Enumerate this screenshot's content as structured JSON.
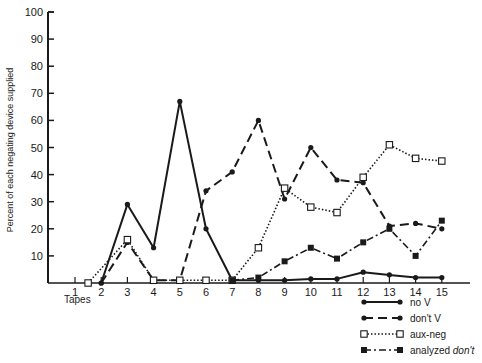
{
  "chart_data": {
    "type": "line",
    "title": "",
    "xlabel": "Tapes",
    "ylabel": "Percent of each negating device supplied",
    "ylim": [
      0,
      100
    ],
    "yticks": [
      10,
      20,
      30,
      40,
      50,
      60,
      70,
      80,
      90,
      100
    ],
    "xticks": [
      1,
      2,
      3,
      4,
      5,
      6,
      7,
      8,
      9,
      10,
      11,
      12,
      13,
      14,
      15
    ],
    "grid": false,
    "legend_position": "bottom-right",
    "series": [
      {
        "name": "no V",
        "style": "solid",
        "marker": "dot",
        "points": [
          [
            2,
            0
          ],
          [
            3,
            29
          ],
          [
            4,
            13
          ],
          [
            5,
            67
          ],
          [
            6,
            20
          ],
          [
            7,
            1
          ],
          [
            8,
            1
          ],
          [
            9,
            1
          ],
          [
            10,
            1.5
          ],
          [
            11,
            1.5
          ],
          [
            12,
            4
          ],
          [
            13,
            3
          ],
          [
            14,
            2
          ],
          [
            15,
            2
          ]
        ]
      },
      {
        "name": "don't V",
        "style": "dashed",
        "marker": "dot",
        "points": [
          [
            2,
            0
          ],
          [
            3,
            15
          ],
          [
            4,
            1
          ],
          [
            5,
            1
          ],
          [
            6,
            34
          ],
          [
            7,
            41
          ],
          [
            8,
            60
          ],
          [
            9,
            31
          ],
          [
            10,
            50
          ],
          [
            11,
            38
          ],
          [
            12,
            37
          ],
          [
            13,
            21
          ],
          [
            14,
            22
          ],
          [
            15,
            20
          ]
        ]
      },
      {
        "name": "aux-neg",
        "style": "dotted",
        "marker": "open-square",
        "points": [
          [
            1.5,
            0
          ],
          [
            3,
            16
          ],
          [
            4,
            1
          ],
          [
            5,
            1
          ],
          [
            6,
            1
          ],
          [
            7,
            1
          ],
          [
            8,
            13
          ],
          [
            9,
            35
          ],
          [
            10,
            28
          ],
          [
            11,
            26
          ],
          [
            12,
            39
          ],
          [
            13,
            51
          ],
          [
            14,
            46
          ],
          [
            15,
            45
          ]
        ]
      },
      {
        "name": "analyzed don't",
        "style": "dash-dot",
        "marker": "filled-square",
        "points": [
          [
            7,
            1
          ],
          [
            8,
            2
          ],
          [
            9,
            8
          ],
          [
            10,
            13
          ],
          [
            11,
            9
          ],
          [
            12,
            15
          ],
          [
            13,
            20
          ],
          [
            14,
            10
          ],
          [
            15,
            23
          ]
        ]
      }
    ]
  },
  "legend": {
    "items": [
      {
        "label": "no V",
        "italic_part": ""
      },
      {
        "label": "don't V",
        "italic_part": ""
      },
      {
        "label": "aux-neg",
        "italic_part": ""
      },
      {
        "label": "analyzed ",
        "italic_part": "don't"
      }
    ]
  }
}
